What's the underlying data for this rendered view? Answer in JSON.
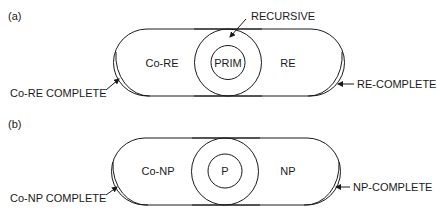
{
  "diagram_a": {
    "panel_label": "(a)",
    "left_region": "Co-RE",
    "right_region": "RE",
    "center_inner": "PRIM",
    "center_label": "RECURSIVE",
    "left_complete": "Co-RE COMPLETE",
    "right_complete": "RE-COMPLETE"
  },
  "diagram_b": {
    "panel_label": "(b)",
    "left_region": "Co-NP",
    "right_region": "NP",
    "center_inner": "P",
    "left_complete": "Co-NP COMPLETE",
    "right_complete": "NP-COMPLETE"
  },
  "colors": {
    "stroke": "#1a1a1a",
    "background": "#ffffff"
  }
}
